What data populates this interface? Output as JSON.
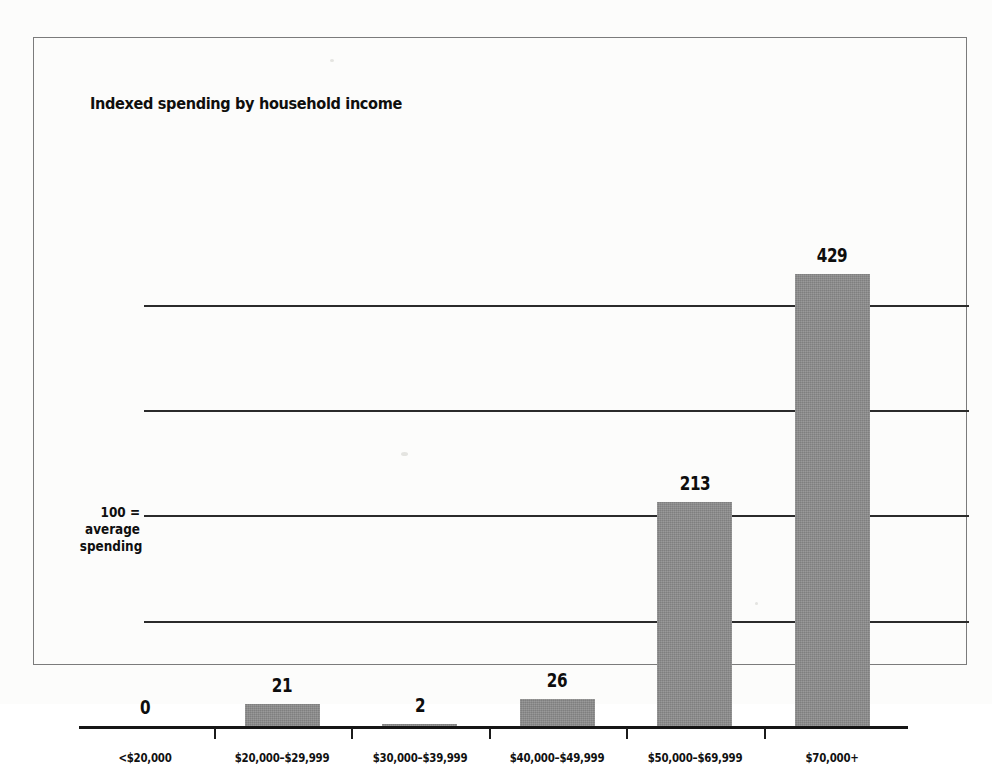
{
  "figure": {
    "title": "Indexed spending by household income",
    "baseline_note_lines": [
      "100 =",
      "average",
      "spending"
    ]
  },
  "chart_data": {
    "type": "bar",
    "title": "Indexed spending by household income",
    "xlabel": "",
    "ylabel": "",
    "categories": [
      "<$20,000",
      "$20,000–$29,999",
      "$30,000–$39,999",
      "$40,000–$49,999",
      "$50,000–$69,999",
      "$70,000+"
    ],
    "values": [
      0,
      21,
      2,
      26,
      213,
      429
    ],
    "value_labels": [
      "0",
      "21",
      "2",
      "26",
      "213",
      "429"
    ],
    "ylim": [
      0,
      500
    ],
    "gridlines": [
      100,
      200,
      300,
      400
    ],
    "grid": true,
    "legend": false,
    "annotation": "100 = average spending",
    "bar_color": "#8d8d8d",
    "axis_color": "#161616"
  }
}
